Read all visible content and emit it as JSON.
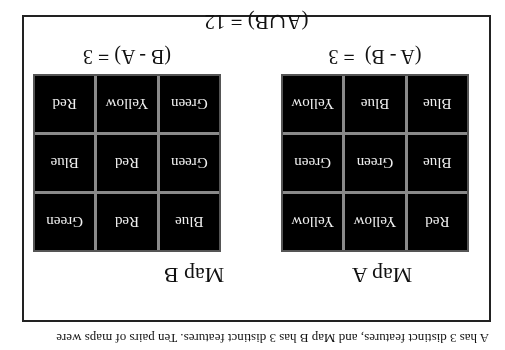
{
  "orientation": "rotated-180",
  "caption": "A has 3 distinct features, and Map B has 3 distinct features.  Ten pairs of  maps were",
  "maps": [
    {
      "title": "Map A",
      "grid": [
        [
          "Red",
          "Yellow",
          "Yellow"
        ],
        [
          "Blue",
          "Green",
          "Green"
        ],
        [
          "Blue",
          "Blue",
          "Yellow"
        ]
      ],
      "difference_label": "(A - B)  = 3"
    },
    {
      "title": "Map B",
      "grid": [
        [
          "Blue",
          "Red",
          "Green"
        ],
        [
          "Green",
          "Red",
          "Blue"
        ],
        [
          "Green",
          "Yellow",
          "Red"
        ]
      ],
      "difference_label": "(B - A) = 3"
    }
  ],
  "union_label": "(A∪B) = 12",
  "colors": {
    "cell_bg": "#000000",
    "cell_text": "#f0f0f0",
    "grid_lines": "#8a8a8a",
    "frame": "#222222"
  }
}
